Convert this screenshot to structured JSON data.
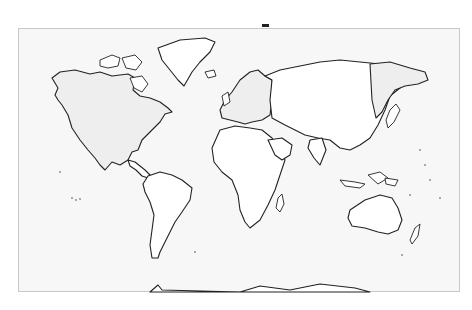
{
  "map": {
    "type": "world-outline",
    "projection": "mercator",
    "colors": {
      "ocean": "#f7f7f7",
      "land": "#ffffff",
      "shaded_land": "#eeeeee",
      "outline": "#222222",
      "frame": "#c8c8c8"
    },
    "shaded_regions": [
      "North America",
      "Europe",
      "Russian Far East"
    ],
    "continents": [
      "North America",
      "South America",
      "Europe",
      "Africa",
      "Asia",
      "Australia",
      "Antarctica",
      "Greenland"
    ]
  }
}
